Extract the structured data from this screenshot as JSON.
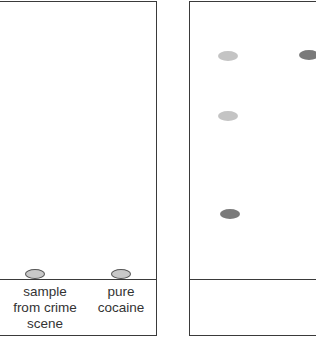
{
  "diagram": {
    "type": "thin layer chromatography",
    "plates": [
      {
        "id": "before",
        "spots": [
          {
            "lane": "sample",
            "color": "#c8c8c8",
            "x": 22,
            "y": 272
          },
          {
            "lane": "cocaine",
            "color": "#c8c8c8",
            "x": 108,
            "y": 272
          }
        ],
        "labels": [
          {
            "lane": "sample",
            "text_lines": [
              "sample",
              "from crime",
              "scene"
            ]
          },
          {
            "lane": "cocaine",
            "text_lines": [
              "pure",
              "cocaine"
            ]
          }
        ]
      },
      {
        "id": "after",
        "spots": [
          {
            "lane": "sample",
            "color": "#c4c4c4",
            "x": 28,
            "y": 49
          },
          {
            "lane": "cocaine",
            "color": "#7a7a7a",
            "x": 109,
            "y": 48
          },
          {
            "lane": "sample",
            "color": "#c4c4c4",
            "x": 28,
            "y": 109
          },
          {
            "lane": "sample",
            "color": "#7a7a7a",
            "x": 30,
            "y": 207
          }
        ]
      }
    ]
  },
  "labels": {
    "sample": [
      "sample",
      "from crime",
      "scene"
    ],
    "cocaine": [
      "pure",
      "cocaine"
    ]
  }
}
